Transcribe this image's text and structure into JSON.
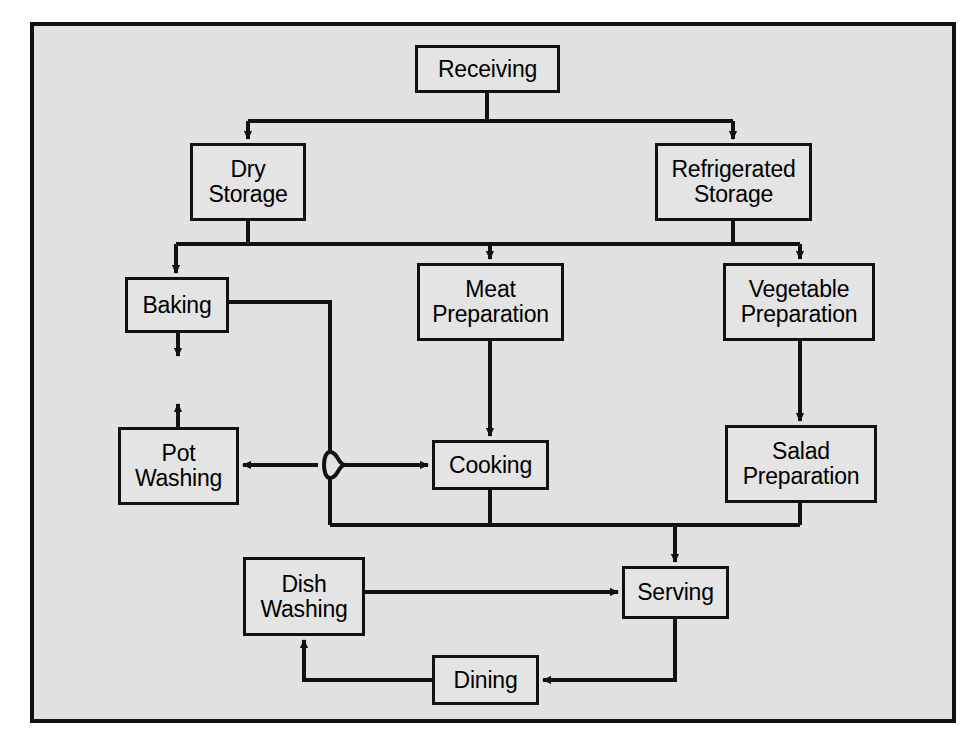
{
  "diagram": {
    "background_color": "#e2e2e2",
    "frame_color": "#111111",
    "box_fill_color": "#e4e4e4",
    "line_color": "#111111",
    "nodes": [
      {
        "id": "receiving",
        "label": "Receiving",
        "x": 415,
        "y": 45,
        "w": 145,
        "h": 48
      },
      {
        "id": "dry_storage",
        "label": "Dry\nStorage",
        "x": 190,
        "y": 143,
        "w": 116,
        "h": 78
      },
      {
        "id": "refrigerated_storage",
        "label": "Refrigerated\nStorage",
        "x": 655,
        "y": 143,
        "w": 157,
        "h": 78
      },
      {
        "id": "baking",
        "label": "Baking",
        "x": 125,
        "y": 277,
        "w": 104,
        "h": 56
      },
      {
        "id": "meat_prep",
        "label": "Meat\nPreparation",
        "x": 417,
        "y": 263,
        "w": 147,
        "h": 78
      },
      {
        "id": "vegetable_prep",
        "label": "Vegetable\nPreparation",
        "x": 723,
        "y": 263,
        "w": 152,
        "h": 78
      },
      {
        "id": "pot_washing",
        "label": "Pot\nWashing",
        "x": 118,
        "y": 427,
        "w": 121,
        "h": 78
      },
      {
        "id": "cooking",
        "label": "Cooking",
        "x": 432,
        "y": 440,
        "w": 117,
        "h": 50
      },
      {
        "id": "salad_prep",
        "label": "Salad\nPreparation",
        "x": 725,
        "y": 425,
        "w": 152,
        "h": 78
      },
      {
        "id": "dish_washing",
        "label": "Dish\nWashing",
        "x": 243,
        "y": 557,
        "w": 122,
        "h": 79
      },
      {
        "id": "serving",
        "label": "Serving",
        "x": 622,
        "y": 566,
        "w": 107,
        "h": 53
      },
      {
        "id": "dining",
        "label": "Dining",
        "x": 432,
        "y": 655,
        "w": 107,
        "h": 50
      }
    ],
    "edges": [
      {
        "from": "receiving",
        "to": "dry_storage",
        "type": "orthogonal-arrow"
      },
      {
        "from": "receiving",
        "to": "refrigerated_storage",
        "type": "orthogonal-arrow"
      },
      {
        "from": "dry_storage",
        "to": "baking",
        "type": "bus-arrow"
      },
      {
        "from": "dry_storage",
        "to": "meat_prep",
        "type": "bus-arrow"
      },
      {
        "from": "dry_storage",
        "to": "vegetable_prep",
        "type": "bus-arrow"
      },
      {
        "from": "refrigerated_storage",
        "to": "meat_prep",
        "type": "bus-arrow"
      },
      {
        "from": "refrigerated_storage",
        "to": "vegetable_prep",
        "type": "bus-arrow"
      },
      {
        "from": "baking",
        "to": "pot_washing",
        "type": "arrow-with-jump"
      },
      {
        "from": "pot_washing",
        "to": "baking",
        "type": "arrow"
      },
      {
        "from": "cooking",
        "to": "pot_washing",
        "type": "arrow-with-jump"
      },
      {
        "from": "pot_washing",
        "to": "cooking",
        "type": "arrow"
      },
      {
        "from": "meat_prep",
        "to": "cooking",
        "type": "arrow"
      },
      {
        "from": "vegetable_prep",
        "to": "salad_prep",
        "type": "arrow"
      },
      {
        "from": "baking",
        "to": "serving",
        "type": "bus-arrow"
      },
      {
        "from": "cooking",
        "to": "serving",
        "type": "bus-arrow"
      },
      {
        "from": "salad_prep",
        "to": "serving",
        "type": "bus-arrow"
      },
      {
        "from": "dish_washing",
        "to": "serving",
        "type": "arrow"
      },
      {
        "from": "serving",
        "to": "dining",
        "type": "orthogonal-arrow"
      },
      {
        "from": "dining",
        "to": "dish_washing",
        "type": "orthogonal-arrow"
      }
    ]
  }
}
